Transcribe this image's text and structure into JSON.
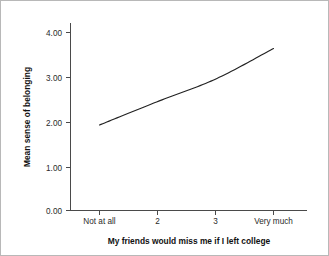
{
  "chart_data": {
    "type": "line",
    "title": "",
    "subtitle": "",
    "xlabel": "My friends would miss me if I left college",
    "ylabel": "Mean sense of belonging",
    "categories": [
      "Not at all",
      "2",
      "3",
      "Very much"
    ],
    "series": [
      {
        "name": "Mean sense of belonging",
        "values": [
          1.9,
          2.42,
          2.92,
          3.6
        ]
      }
    ],
    "ylim": [
      0.0,
      4.35
    ],
    "y_ticks": [
      0.0,
      1.0,
      2.0,
      3.0,
      4.0
    ],
    "y_tick_labels": [
      "0.00",
      "1.00",
      "2.00",
      "3.00",
      "4.00"
    ],
    "x_tick_labels": [
      "Not at all",
      "2",
      "3",
      "Very much"
    ],
    "grid": false,
    "legend": false,
    "legend_position": "none",
    "line_color": "#222222",
    "background_color": "#ffffff",
    "axis_color": "#4a4a4a",
    "annotations": []
  },
  "axes": {
    "y_axis_title": "Mean sense of belonging",
    "x_axis_title": "My friends would miss me if I left college"
  }
}
